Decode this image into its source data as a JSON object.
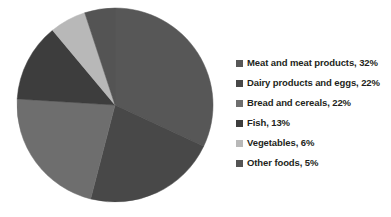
{
  "chart_data": {
    "type": "pie",
    "title": "",
    "subtitle": "",
    "xlabel": "",
    "ylabel": "",
    "grid": false,
    "legend_position": "right",
    "start_angle_deg": 0,
    "direction": "clockwise",
    "categories": [
      "Meat and meat products",
      "Dairy products and eggs",
      "Bread and cereals",
      "Fish",
      "Vegetables",
      "Other foods"
    ],
    "values": [
      32,
      22,
      22,
      13,
      6,
      5
    ],
    "value_unit": "%",
    "colors": [
      "#575757",
      "#484848",
      "#6e6e6e",
      "#3d3d3d",
      "#b8b8b8",
      "#545454"
    ],
    "slices": [
      {
        "label": "Meat and meat products",
        "value": 32,
        "display": "32%",
        "color": "#575757"
      },
      {
        "label": "Dairy products and eggs",
        "value": 22,
        "display": "22%",
        "color": "#484848"
      },
      {
        "label": "Bread and cereals",
        "value": 22,
        "display": "22%",
        "color": "#6e6e6e"
      },
      {
        "label": "Fish",
        "value": 13,
        "display": "13%",
        "color": "#3d3d3d"
      },
      {
        "label": "Vegetables",
        "value": 6,
        "display": "6%",
        "color": "#b8b8b8"
      },
      {
        "label": "Other foods",
        "value": 5,
        "display": "5%",
        "color": "#545454"
      }
    ]
  },
  "legend": {
    "entries": [
      {
        "text": "Meat and meat products, 32%",
        "color": "#575757"
      },
      {
        "text": "Dairy products and eggs, 22%",
        "color": "#484848"
      },
      {
        "text": "Bread and cereals, 22%",
        "color": "#6e6e6e"
      },
      {
        "text": "Fish, 13%",
        "color": "#3d3d3d"
      },
      {
        "text": "Vegetables, 6%",
        "color": "#b8b8b8"
      },
      {
        "text": "Other foods, 5%",
        "color": "#545454"
      }
    ]
  },
  "geometry": {
    "center_x": 115,
    "center_y": 105,
    "radius_x": 98,
    "radius_y": 97
  }
}
